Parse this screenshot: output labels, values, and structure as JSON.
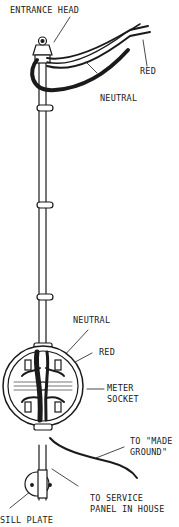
{
  "diagram": {
    "labels": {
      "entrance_head": "ENTRANCE HEAD",
      "red_top": "RED",
      "neutral_top": "NEUTRAL",
      "neutral_socket": "NEUTRAL",
      "red_socket": "RED",
      "meter_socket_1": "METER",
      "meter_socket_2": "SOCKET",
      "made_ground_1": "TO \"MADE",
      "made_ground_2": "GROUND\"",
      "service_panel_1": "TO SERVICE",
      "service_panel_2": "PANEL IN HOUSE",
      "sill_plate": "SILL PLATE"
    },
    "colors": {
      "ink": "#1a1a1a",
      "background": "#ffffff"
    }
  }
}
